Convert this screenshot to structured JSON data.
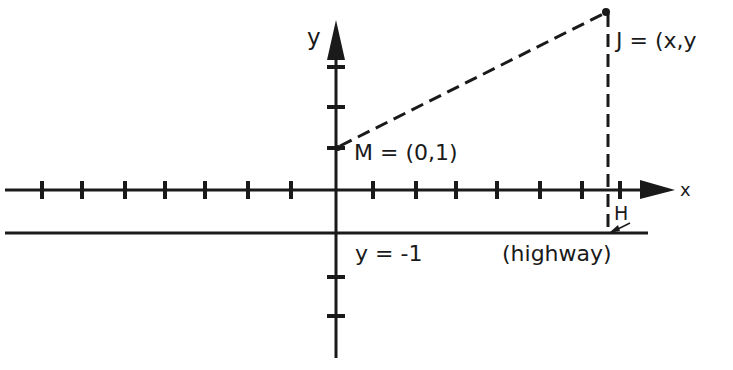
{
  "diagram": {
    "axes": {
      "x_label": "x",
      "y_label": "y",
      "x_ticks_left_count": 7,
      "x_ticks_right_count": 7,
      "y_ticks_above_count": 3,
      "y_ticks_below_count": 2
    },
    "points": {
      "J": {
        "label": "J = (x,y",
        "name": "J"
      },
      "M": {
        "label": "M = (0,1)",
        "name": "M"
      },
      "H": {
        "label": "H",
        "name": "H"
      }
    },
    "lines": {
      "highway_equation": "y = -1",
      "highway_label": "(highway)"
    },
    "colors": {
      "ink": "#1a1a1a",
      "background": "#ffffff"
    }
  }
}
